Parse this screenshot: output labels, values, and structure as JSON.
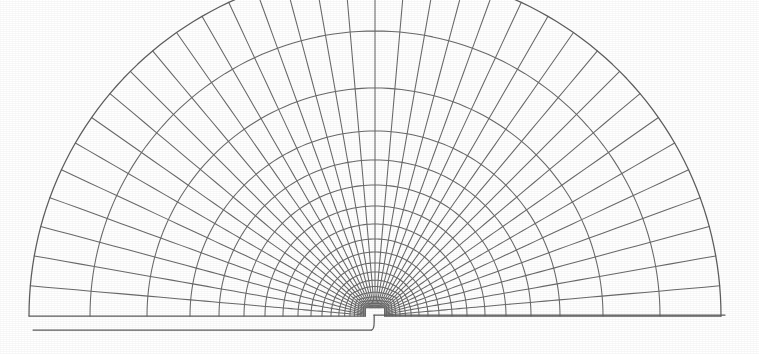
{
  "figure": {
    "kind": "finite-element-mesh",
    "title": "",
    "caption": "",
    "background_color": "#ffffff",
    "line_color": "#6a6a6a",
    "boundary_line_color": "#5e5e5e",
    "line_width": 1.05,
    "width_px": 759,
    "height_px": 354
  },
  "chart_data": {
    "type": "diagram",
    "subtype": "polar-finite-element-mesh",
    "title": "",
    "xlabel": "",
    "ylabel": "",
    "grid": false,
    "legend": null,
    "annotations": [],
    "geometry": {
      "domain": "half-disk (semicircular) with a small rectangular notch at the bottom centre",
      "center_px": [
        375,
        316
      ],
      "outer_radius_px": 346,
      "inner_radius_px": 9,
      "angle_start_deg": 0,
      "angle_end_deg": 180,
      "left_base_y_px": 330,
      "right_base_y_px": 315,
      "left_base_x_start_px": 33,
      "right_base_x_end_px": 725,
      "notch": {
        "x_px": 372,
        "depth_px": 15,
        "corner_radius_px": 12,
        "side": "left-of-centre"
      }
    },
    "mesh": {
      "radial_spokes": 37,
      "angular_divisions": 36,
      "angular_step_deg": 5,
      "rings": 19,
      "grading": "geometric, refined toward the notch tip",
      "grading_ratio": 1.32,
      "ring_radii_px": [
        9,
        11,
        13.5,
        16.5,
        20,
        24.5,
        30,
        36,
        44,
        53,
        64,
        77,
        92,
        110,
        131,
        156,
        185,
        228,
        285,
        346
      ],
      "element_shape": "quadrilateral",
      "element_count_approx": 684
    }
  }
}
